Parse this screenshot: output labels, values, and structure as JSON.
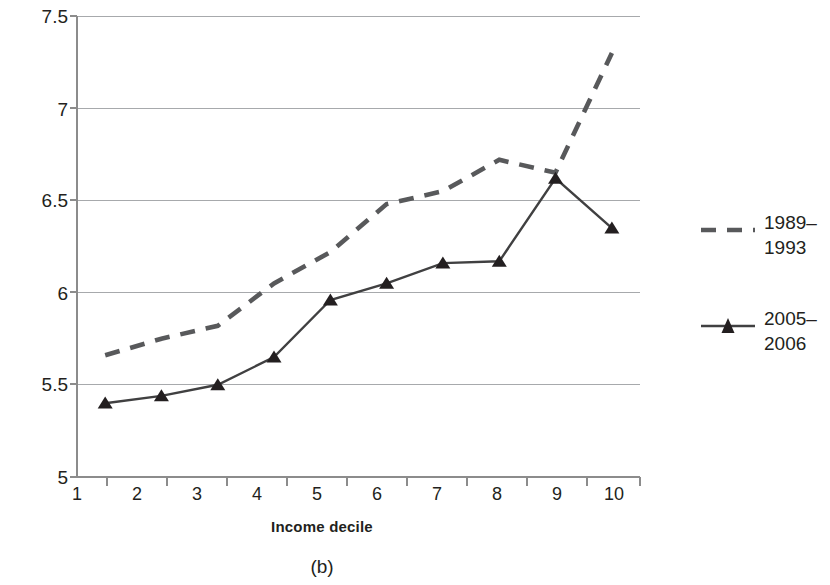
{
  "chart_data": {
    "type": "line",
    "title": "",
    "subtitle": "",
    "caption": "(b)",
    "xlabel": "Income decile",
    "ylabel": "",
    "categories": [
      "1",
      "2",
      "3",
      "4",
      "5",
      "6",
      "7",
      "8",
      "9",
      "10"
    ],
    "x": [
      1,
      2,
      3,
      4,
      5,
      6,
      7,
      8,
      9,
      10
    ],
    "ylim": [
      5,
      7.5
    ],
    "yticks": [
      "7.5",
      "7",
      "6.5",
      "6",
      "5.5",
      "5"
    ],
    "ytick_values": [
      7.5,
      7,
      6.5,
      6,
      5.5,
      5
    ],
    "grid": true,
    "grid_axis": "y",
    "legend_position": "right",
    "series": [
      {
        "name": "1989–1993",
        "style": "dashed",
        "marker": "none",
        "color": "#58595b",
        "values": [
          5.66,
          5.75,
          5.82,
          6.05,
          6.22,
          6.48,
          6.55,
          6.72,
          6.65,
          7.3
        ]
      },
      {
        "name": "2005–2006",
        "style": "solid",
        "marker": "triangle",
        "color": "#404041",
        "values": [
          5.4,
          5.44,
          5.5,
          5.65,
          5.96,
          6.05,
          6.16,
          6.17,
          6.62,
          6.35
        ]
      }
    ]
  },
  "legend": {
    "entries": [
      {
        "label": "1989–\n1993"
      },
      {
        "label": "2005–\n2006"
      }
    ]
  },
  "colors": {
    "axis": "#8c8c8c",
    "grid": "#a7a9ac",
    "series_dashed": "#58595b",
    "series_solid": "#404041",
    "text": "#231f20",
    "background": "#ffffff"
  }
}
